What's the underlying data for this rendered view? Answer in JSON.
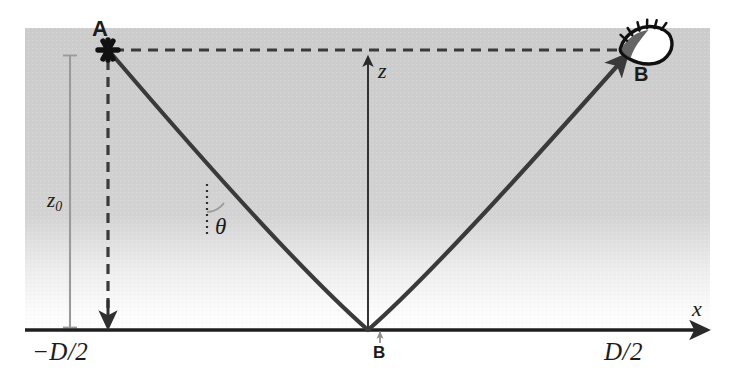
{
  "figure": {
    "type": "ray-diagram",
    "width": 735,
    "height": 385,
    "background_color": "#ffffff",
    "haze_color": "#cfcfcf",
    "ink_color": "#2a2a2a",
    "guide_color": "#999999"
  },
  "axes": {
    "x_axis_label": "x",
    "z_axis_label": "z",
    "x_tick_left_label": "−D/2",
    "x_tick_right_label": "D/2",
    "origin_marker_label": "B",
    "x_axis_y": 330,
    "x_axis_x_start": 25,
    "x_axis_x_end": 715,
    "z_axis_x": 368,
    "z_axis_y_top": 52,
    "z_axis_y_bottom": 330
  },
  "points": {
    "source": {
      "label": "A",
      "marker": "asterisk-star",
      "x": 108,
      "y": 50
    },
    "observer": {
      "label": "B",
      "marker": "eye-icon",
      "x": 640,
      "y": 48
    },
    "ground_projection": {
      "label": "B",
      "x": 380,
      "y": 330
    }
  },
  "measures": {
    "height_label": "z",
    "height_subscript": "0",
    "height_label_full": "z₀",
    "angle_label": "θ",
    "angle_description": "angle between the local vertical and the ray tangent"
  },
  "ray": {
    "description": "Downward-curving ray from A, grazing the ground at the origin, then curving up to observer B",
    "path": "M 108 50 C 190 145, 300 270, 368 330 C 436 270, 546 145, 628 55",
    "stroke_width": 4.2,
    "arrow_at": "observer"
  },
  "guides": {
    "horizontal_dashed": {
      "from_x": 112,
      "to_x": 634,
      "y": 50,
      "dash": "10 7"
    },
    "vertical_dashed": {
      "x": 108,
      "from_y": 58,
      "to_y": 322,
      "dash": "10 7",
      "arrow": "down"
    },
    "angle_dotted": {
      "x": 207,
      "from_y": 184,
      "to_y": 236,
      "dash": "2 4"
    },
    "z0_bracket": {
      "x": 70,
      "from_y": 55,
      "to_y": 328
    }
  }
}
